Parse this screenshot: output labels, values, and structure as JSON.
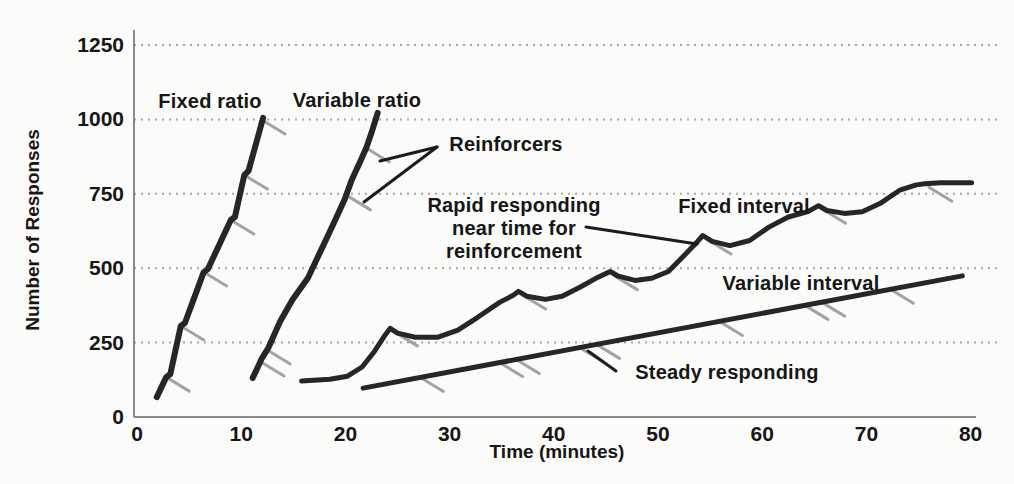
{
  "chart_data": {
    "type": "line",
    "xlabel": "Time (minutes)",
    "ylabel": "Number of Responses",
    "xlim": [
      0,
      80
    ],
    "ylim": [
      0,
      1250
    ],
    "x_ticks": [
      0,
      10,
      20,
      30,
      40,
      50,
      60,
      70,
      80
    ],
    "y_ticks": [
      0,
      250,
      500,
      750,
      1000,
      1250
    ],
    "grid": "horizontal-dotted",
    "legend_position": "none",
    "colors": {
      "curve": "#262626",
      "reinforcer_tick": "#a3a3a3",
      "gridline": "#a8a8a8",
      "axis": "#8a8a8a",
      "text": "#161616",
      "background": "#fbfbf9"
    },
    "series": [
      {
        "name": "Fixed ratio",
        "stroke_width": 6,
        "points": [
          [
            1.9,
            67
          ],
          [
            2.8,
            134
          ],
          [
            3.2,
            144
          ],
          [
            4.2,
            306
          ],
          [
            4.6,
            316
          ],
          [
            6.4,
            487
          ],
          [
            6.8,
            497
          ],
          [
            9.0,
            662
          ],
          [
            9.4,
            672
          ],
          [
            10.3,
            813
          ],
          [
            10.7,
            827
          ],
          [
            12.1,
            1005
          ]
        ],
        "reinforcer_marks": [
          [
            2.8,
            134
          ],
          [
            4.2,
            306
          ],
          [
            6.4,
            487
          ],
          [
            9.0,
            662
          ],
          [
            10.3,
            813
          ],
          [
            12.0,
            998
          ]
        ]
      },
      {
        "name": "Variable ratio",
        "stroke_width": 6,
        "points": [
          [
            11.1,
            131
          ],
          [
            12.0,
            198
          ],
          [
            12.6,
            232
          ],
          [
            13.7,
            319
          ],
          [
            14.9,
            393
          ],
          [
            16.4,
            467
          ],
          [
            17.8,
            571
          ],
          [
            18.8,
            645
          ],
          [
            19.9,
            729
          ],
          [
            20.6,
            796
          ],
          [
            21.4,
            857
          ],
          [
            22.0,
            904
          ],
          [
            22.5,
            954
          ],
          [
            23.1,
            1022
          ]
        ],
        "reinforcer_marks": [
          [
            11.9,
            185
          ],
          [
            12.5,
            225
          ],
          [
            20.2,
            743
          ],
          [
            22.0,
            904
          ]
        ]
      },
      {
        "name": "Fixed interval",
        "stroke_width": 5,
        "points": [
          [
            15.8,
            121
          ],
          [
            18.5,
            127
          ],
          [
            20.2,
            137
          ],
          [
            21.6,
            168
          ],
          [
            22.8,
            221
          ],
          [
            23.8,
            275
          ],
          [
            24.3,
            298
          ],
          [
            25.0,
            282
          ],
          [
            26.7,
            268
          ],
          [
            28.9,
            268
          ],
          [
            30.8,
            292
          ],
          [
            32.7,
            335
          ],
          [
            34.8,
            385
          ],
          [
            36.1,
            409
          ],
          [
            36.6,
            422
          ],
          [
            37.4,
            406
          ],
          [
            39.2,
            395
          ],
          [
            40.8,
            406
          ],
          [
            42.5,
            436
          ],
          [
            44.2,
            469
          ],
          [
            45.4,
            489
          ],
          [
            46.2,
            473
          ],
          [
            47.8,
            459
          ],
          [
            49.4,
            466
          ],
          [
            51.0,
            489
          ],
          [
            52.6,
            546
          ],
          [
            53.8,
            590
          ],
          [
            54.3,
            610
          ],
          [
            55.2,
            590
          ],
          [
            56.9,
            576
          ],
          [
            58.8,
            593
          ],
          [
            60.6,
            637
          ],
          [
            62.5,
            672
          ],
          [
            64.4,
            690
          ],
          [
            65.4,
            710
          ],
          [
            66.2,
            694
          ],
          [
            67.9,
            684
          ],
          [
            69.6,
            690
          ],
          [
            71.3,
            717
          ],
          [
            73.2,
            762
          ],
          [
            74.8,
            780
          ],
          [
            75.6,
            784
          ],
          [
            77.1,
            787
          ],
          [
            80.1,
            787
          ]
        ],
        "reinforcer_marks": [
          [
            24.7,
            286
          ],
          [
            37.0,
            410
          ],
          [
            45.8,
            475
          ],
          [
            54.8,
            595
          ],
          [
            65.8,
            698
          ],
          [
            76.0,
            772
          ]
        ]
      },
      {
        "name": "Variable interval",
        "stroke_width": 5,
        "points": [
          [
            21.7,
            97
          ],
          [
            79.2,
            474
          ]
        ],
        "reinforcer_marks": [
          [
            27.2,
            133
          ],
          [
            34.8,
            183
          ],
          [
            36.4,
            193
          ],
          [
            42.5,
            233
          ],
          [
            44.1,
            244
          ],
          [
            55.9,
            321
          ],
          [
            64.1,
            375
          ],
          [
            65.7,
            386
          ],
          [
            72.3,
            429
          ]
        ]
      }
    ],
    "annotations": [
      {
        "id": "fixed-ratio-label",
        "text": "Fixed ratio",
        "x": 210,
        "y": 101
      },
      {
        "id": "variable-ratio-label",
        "text": "Variable ratio",
        "x": 357,
        "y": 100
      },
      {
        "id": "reinforcers-label",
        "text": "Reinforcers",
        "x": 506,
        "y": 144,
        "leaders": [
          [
            437,
            147,
            380,
            161
          ],
          [
            437,
            147,
            364,
            202
          ]
        ]
      },
      {
        "id": "rapid-responding-label",
        "text": "Rapid responding\nnear time for\nreinforcement",
        "x": 514,
        "y": 228,
        "leaders": [
          [
            586,
            227,
            697,
            244
          ]
        ]
      },
      {
        "id": "fixed-interval-label",
        "text": "Fixed interval",
        "x": 744,
        "y": 206
      },
      {
        "id": "variable-interval-label",
        "text": "Variable interval",
        "x": 801,
        "y": 283
      },
      {
        "id": "steady-responding-label",
        "text": "Steady responding",
        "x": 727,
        "y": 372,
        "leaders": [
          [
            616,
            371,
            588,
            351
          ]
        ]
      }
    ]
  }
}
